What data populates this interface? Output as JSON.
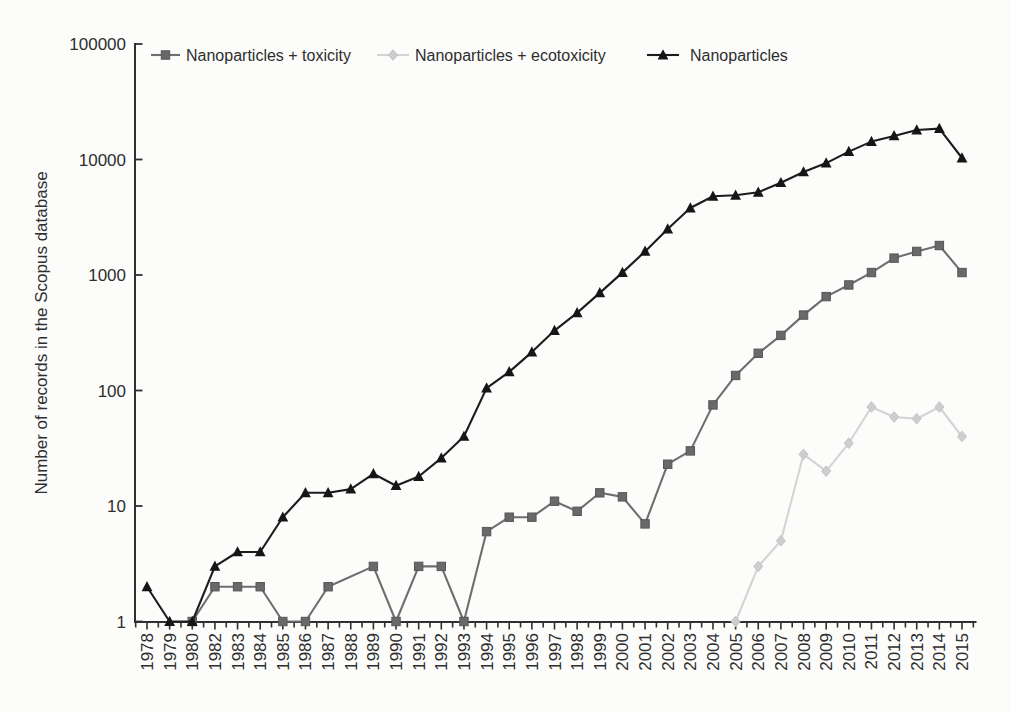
{
  "chart_data": {
    "type": "line",
    "title": "",
    "xlabel": "",
    "ylabel": "Number of records in the Scopus database",
    "y_scale": "log",
    "ylim": [
      1,
      100000
    ],
    "grid": false,
    "legend_position": "top",
    "ytick_values": [
      1,
      10,
      100,
      1000,
      10000,
      100000
    ],
    "ytick_labels": [
      "1",
      "10",
      "100",
      "1000",
      "10000",
      "100000"
    ],
    "categories": [
      "1978",
      "1979",
      "1980",
      "1982",
      "1983",
      "1984",
      "1985",
      "1986",
      "1987",
      "1988",
      "1989",
      "1990",
      "1991",
      "1992",
      "1993",
      "1994",
      "1995",
      "1996",
      "1997",
      "1998",
      "1999",
      "2000",
      "2001",
      "2002",
      "2003",
      "2004",
      "2005",
      "2006",
      "2007",
      "2008",
      "2009",
      "2010",
      "2011",
      "2012",
      "2013",
      "2014",
      "2015"
    ],
    "series": [
      {
        "name": "Nanoparticles + toxicity",
        "marker": "square",
        "color": "#6e6e6e",
        "marker_color": "#696969",
        "marker_edge": "#565656",
        "values": [
          null,
          null,
          1,
          2,
          2,
          2,
          1,
          1,
          2,
          null,
          3,
          1,
          3,
          3,
          1,
          6,
          8,
          8,
          11,
          9,
          13,
          12,
          7,
          23,
          30,
          75,
          135,
          210,
          300,
          450,
          650,
          820,
          1050,
          1400,
          1600,
          1800,
          1050
        ]
      },
      {
        "name": "Nanoparticles + ecotoxicity",
        "marker": "diamond",
        "color": "#d4d4d4",
        "marker_color": "#cecece",
        "marker_edge": "#c2c2c2",
        "values": [
          null,
          null,
          null,
          null,
          null,
          null,
          null,
          null,
          null,
          null,
          null,
          null,
          null,
          null,
          null,
          null,
          null,
          null,
          null,
          null,
          null,
          null,
          null,
          null,
          null,
          null,
          1,
          3,
          5,
          28,
          20,
          35,
          72,
          59,
          57,
          72,
          40
        ]
      },
      {
        "name": "Nanoparticles",
        "marker": "triangle",
        "color": "#1c1c1c",
        "marker_color": "#161616",
        "marker_edge": "#161616",
        "values": [
          2,
          1,
          1,
          3,
          4,
          4,
          8,
          13,
          13,
          14,
          19,
          15,
          18,
          26,
          40,
          105,
          145,
          215,
          330,
          470,
          700,
          1050,
          1600,
          2500,
          3800,
          4800,
          4900,
          5200,
          6300,
          7800,
          9300,
          11700,
          14300,
          16000,
          18000,
          18500,
          10300
        ]
      }
    ]
  }
}
